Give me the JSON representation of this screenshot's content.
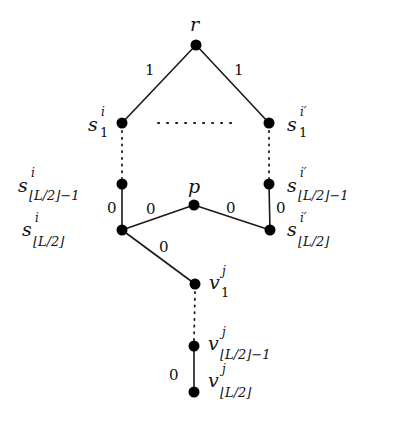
{
  "diagram": {
    "type": "tree-graph",
    "colors": {
      "edge": "#1a1a1a",
      "node": "#000000",
      "text": "#111111",
      "background": "#ffffff"
    },
    "nodes": {
      "r": {
        "id": "r",
        "label": "r",
        "x": 196,
        "y": 45
      },
      "s1i": {
        "id": "s_1^i",
        "base": "s",
        "sup": "i",
        "sub": "1",
        "x": 122,
        "y": 123
      },
      "s1ip": {
        "id": "s_1^i'",
        "base": "s",
        "sup": "i′",
        "sub": "1",
        "x": 269,
        "y": 123
      },
      "sLm1i": {
        "id": "s_{⌊L/2⌋-1}^i",
        "base": "s",
        "sup": "i",
        "sub": "⌊L/2⌋−1",
        "x": 122,
        "y": 184
      },
      "sLm1ip": {
        "id": "s_{⌊L/2⌋-1}^i'",
        "base": "s",
        "sup": "i′",
        "sub": "⌊L/2⌋−1",
        "x": 269,
        "y": 184
      },
      "p": {
        "id": "p",
        "label": "p",
        "x": 194,
        "y": 205
      },
      "sLi": {
        "id": "s_{⌊L/2⌋}^i",
        "base": "s",
        "sup": "i",
        "sub": "⌊L/2⌋",
        "x": 122,
        "y": 230
      },
      "sLip": {
        "id": "s_{⌊L/2⌋}^i'",
        "base": "s",
        "sup": "i′",
        "sub": "⌊L/2⌋",
        "x": 270,
        "y": 230
      },
      "v1j": {
        "id": "v_1^j",
        "base": "v",
        "sup": "j",
        "sub": "1",
        "x": 195,
        "y": 284
      },
      "vLm1j": {
        "id": "v_{⌊L/2⌋-1}^j",
        "base": "v",
        "sup": "j",
        "sub": "⌊L/2⌋−1",
        "x": 194,
        "y": 346
      },
      "vLj": {
        "id": "v_{⌊L/2⌋}^j",
        "base": "v",
        "sup": "j",
        "sub": "⌊L/2⌋",
        "x": 194,
        "y": 392
      }
    },
    "edges": [
      {
        "from": "r",
        "to": "s_1^i",
        "weight": "1",
        "style": "solid"
      },
      {
        "from": "r",
        "to": "s_1^i'",
        "weight": "1",
        "style": "solid"
      },
      {
        "from": "s_1^i",
        "to": "s_1^i'",
        "weight": "",
        "style": "dotted"
      },
      {
        "from": "s_1^i",
        "to": "s_{⌊L/2⌋-1}^i",
        "weight": "",
        "style": "dotted"
      },
      {
        "from": "s_1^i'",
        "to": "s_{⌊L/2⌋-1}^i'",
        "weight": "",
        "style": "dotted"
      },
      {
        "from": "s_{⌊L/2⌋-1}^i",
        "to": "s_{⌊L/2⌋}^i",
        "weight": "0",
        "style": "solid"
      },
      {
        "from": "s_{⌊L/2⌋-1}^i'",
        "to": "s_{⌊L/2⌋}^i'",
        "weight": "0",
        "style": "solid"
      },
      {
        "from": "s_{⌊L/2⌋}^i",
        "to": "p",
        "weight": "0",
        "style": "solid"
      },
      {
        "from": "p",
        "to": "s_{⌊L/2⌋}^i'",
        "weight": "0",
        "style": "solid"
      },
      {
        "from": "s_{⌊L/2⌋}^i",
        "to": "v_1^j",
        "weight": "0",
        "style": "solid"
      },
      {
        "from": "v_1^j",
        "to": "v_{⌊L/2⌋-1}^j",
        "weight": "",
        "style": "dotted"
      },
      {
        "from": "v_{⌊L/2⌋-1}^j",
        "to": "v_{⌊L/2⌋}^j",
        "weight": "0",
        "style": "solid"
      }
    ],
    "edge_labels": {
      "r_left": "1",
      "r_right": "1",
      "left_vertical": "0",
      "right_vertical": "0",
      "left_to_p": "0",
      "p_to_right": "0",
      "left_to_v": "0",
      "v_bottom": "0"
    }
  }
}
